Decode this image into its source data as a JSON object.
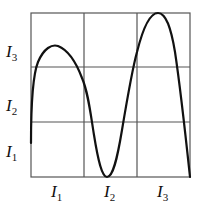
{
  "diagram": {
    "type": "curve-on-grid",
    "grid": {
      "cols": 3,
      "rows": 3
    },
    "y_labels": [
      {
        "base": "I",
        "sub": "3"
      },
      {
        "base": "I",
        "sub": "2"
      },
      {
        "base": "I",
        "sub": "1"
      }
    ],
    "x_labels": [
      {
        "base": "I",
        "sub": "1"
      },
      {
        "base": "I",
        "sub": "2"
      },
      {
        "base": "I",
        "sub": "3"
      }
    ],
    "colors": {
      "grid": "#555555",
      "curve": "#111111"
    }
  }
}
